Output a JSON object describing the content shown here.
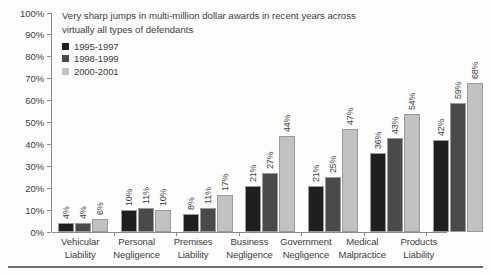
{
  "chart_data": {
    "type": "bar",
    "title": "Very sharp jumps in multi-million dollar awards in recent years across virtually all types of defendants",
    "xlabel": "",
    "ylabel": "",
    "ylim": [
      0,
      100
    ],
    "ytick_labels": [
      "100%",
      "90%",
      "80%",
      "70%",
      "60%",
      "50%",
      "40%",
      "30%",
      "20%",
      "10%",
      "0%"
    ],
    "ytick_values": [
      100,
      90,
      80,
      70,
      60,
      50,
      40,
      30,
      20,
      10,
      0
    ],
    "grid": false,
    "legend_position": "top-left",
    "value_label_suffix": "%",
    "categories": [
      "Vehicular Liability",
      "Personal Negligence",
      "Premises Liability",
      "Business Negligence",
      "Government Negligence",
      "Medical Malpractice",
      "Products Liability"
    ],
    "category_lines": [
      [
        "Vehicular",
        "Liability"
      ],
      [
        "Personal",
        "Negligence"
      ],
      [
        "Premises",
        "Liability"
      ],
      [
        "Business",
        "Negligence"
      ],
      [
        "Government",
        "Negligence"
      ],
      [
        "Medical",
        "Malpractice"
      ],
      [
        "Products",
        "Liability"
      ]
    ],
    "series": [
      {
        "name": "1995-1997",
        "color": "#1f1f1f",
        "values": [
          4,
          10,
          8,
          21,
          21,
          36,
          42
        ],
        "labels": [
          "4%",
          "10%",
          "8%",
          "21%",
          "21%",
          "36%",
          "42%"
        ]
      },
      {
        "name": "1998-1999",
        "color": "#4a4a4a",
        "values": [
          4,
          11,
          11,
          27,
          25,
          43,
          59
        ],
        "labels": [
          "4%",
          "11%",
          "11%",
          "27%",
          "25%",
          "43%",
          "59%"
        ]
      },
      {
        "name": "2000-2001",
        "color": "#c2c2c2",
        "values": [
          6,
          10,
          17,
          44,
          47,
          54,
          68
        ],
        "labels": [
          "6%",
          "10%",
          "17%",
          "44%",
          "47%",
          "54%",
          "68%"
        ]
      }
    ]
  }
}
